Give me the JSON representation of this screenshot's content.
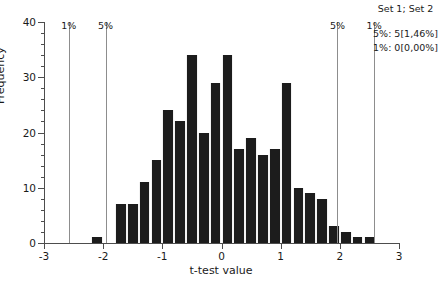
{
  "chart_data": {
    "type": "bar",
    "title": "",
    "subtitle": "",
    "xlabel": "t-test value",
    "ylabel": "Frequency",
    "xlim": [
      -3,
      3
    ],
    "ylim": [
      0,
      40
    ],
    "grid": false,
    "bin_width": 0.2,
    "x_ticks": [
      {
        "value": -3,
        "label": "-3"
      },
      {
        "value": -2,
        "label": "-2"
      },
      {
        "value": -1,
        "label": "-1"
      },
      {
        "value": 0,
        "label": "0"
      },
      {
        "value": 1,
        "label": "1"
      },
      {
        "value": 2,
        "label": "2"
      },
      {
        "value": 3,
        "label": "3"
      }
    ],
    "y_ticks": [
      {
        "value": 0,
        "label": "0"
      },
      {
        "value": 10,
        "label": "10"
      },
      {
        "value": 20,
        "label": "20"
      },
      {
        "value": 30,
        "label": "30"
      },
      {
        "value": 40,
        "label": "40"
      }
    ],
    "y_minor_step": 2,
    "bar_color": "#1c1c1c",
    "axis_color": "#4d4d4d",
    "threshold_color": "#8d8d8d",
    "categories": [
      "-2.2",
      "-2.0",
      "-1.8",
      "-1.6",
      "-1.4",
      "-1.2",
      "-1.0",
      "-0.8",
      "-0.6",
      "-0.4",
      "-0.2",
      "0.0",
      "0.2",
      "0.4",
      "0.6",
      "0.8",
      "1.0",
      "1.2",
      "1.4",
      "1.6",
      "1.8",
      "2.0",
      "2.2",
      "2.4"
    ],
    "bins": [
      {
        "x0": -2.2,
        "x1": -2.0,
        "value": 1
      },
      {
        "x0": -1.8,
        "x1": -1.6,
        "value": 7
      },
      {
        "x0": -1.6,
        "x1": -1.4,
        "value": 7
      },
      {
        "x0": -1.4,
        "x1": -1.2,
        "value": 11
      },
      {
        "x0": -1.2,
        "x1": -1.0,
        "value": 15
      },
      {
        "x0": -1.0,
        "x1": -0.8,
        "value": 24
      },
      {
        "x0": -0.8,
        "x1": -0.6,
        "value": 22
      },
      {
        "x0": -0.6,
        "x1": -0.4,
        "value": 34
      },
      {
        "x0": -0.4,
        "x1": -0.2,
        "value": 20
      },
      {
        "x0": -0.2,
        "x1": 0.0,
        "value": 29
      },
      {
        "x0": 0.0,
        "x1": 0.2,
        "value": 34
      },
      {
        "x0": 0.2,
        "x1": 0.4,
        "value": 17
      },
      {
        "x0": 0.4,
        "x1": 0.6,
        "value": 19
      },
      {
        "x0": 0.6,
        "x1": 0.8,
        "value": 16
      },
      {
        "x0": 0.8,
        "x1": 1.0,
        "value": 17
      },
      {
        "x0": 1.0,
        "x1": 1.2,
        "value": 29
      },
      {
        "x0": 1.2,
        "x1": 1.4,
        "value": 10
      },
      {
        "x0": 1.4,
        "x1": 1.6,
        "value": 9
      },
      {
        "x0": 1.6,
        "x1": 1.8,
        "value": 8
      },
      {
        "x0": 1.8,
        "x1": 2.0,
        "value": 3
      },
      {
        "x0": 2.0,
        "x1": 2.2,
        "value": 2
      },
      {
        "x0": 2.2,
        "x1": 2.4,
        "value": 1
      },
      {
        "x0": 2.4,
        "x1": 2.6,
        "value": 1
      }
    ],
    "thresholds": [
      {
        "id": "lower-1pct",
        "value": -2.58,
        "label": "1%"
      },
      {
        "id": "lower-5pct",
        "value": -1.96,
        "label": "5%"
      },
      {
        "id": "upper-5pct",
        "value": 1.96,
        "label": "5%"
      },
      {
        "id": "upper-1pct",
        "value": 2.58,
        "label": "1%"
      }
    ],
    "legend_position": "top-right"
  },
  "legend": {
    "title": "Set 1; Set 2",
    "rows": [
      "5%: 5[1,46%]",
      "1%: 0[0,00%]"
    ]
  }
}
